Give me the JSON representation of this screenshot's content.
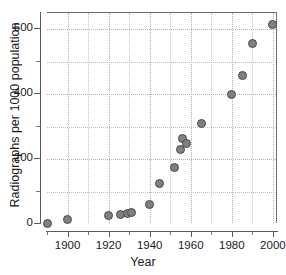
{
  "figure": {
    "background_color": "#ffffff",
    "axis_color": "#5a5a5a",
    "grid_color": "#c2c2c2",
    "marker_fill": "#808080",
    "marker_edge": "#4a4a4a"
  },
  "chart_data": {
    "type": "scatter",
    "title": "",
    "subtitle": "",
    "xlabel": "Year",
    "ylabel": "Radiographs per 1000 population",
    "xlim": [
      1890,
      2002
    ],
    "ylim": [
      0,
      650
    ],
    "grid": true,
    "legend": null,
    "legend_position": "none",
    "x_major_ticks": [
      1900,
      1920,
      1940,
      1960,
      1980,
      2000
    ],
    "x_major_tick_labels": [
      "1900",
      "1920",
      "1940",
      "1960",
      "1980",
      "2000"
    ],
    "x_minor_ticks": [
      1890,
      1910,
      1930,
      1950,
      1970,
      1990
    ],
    "y_major_ticks": [
      0,
      200,
      400,
      600
    ],
    "y_major_tick_labels": [
      "0",
      "200",
      "400",
      "600"
    ],
    "y_minor_ticks": [
      100,
      300,
      500
    ],
    "series": [
      {
        "name": "Radiographs per 1000 population",
        "marker": "circle",
        "x": [
          1890,
          1900,
          1920,
          1926,
          1929,
          1931,
          1940,
          1945,
          1952,
          1955,
          1956,
          1958,
          1965,
          1980,
          1985,
          1990,
          2000
        ],
        "y": [
          2,
          15,
          25,
          28,
          32,
          35,
          60,
          125,
          175,
          230,
          262,
          248,
          310,
          398,
          458,
          555,
          615
        ]
      }
    ]
  }
}
